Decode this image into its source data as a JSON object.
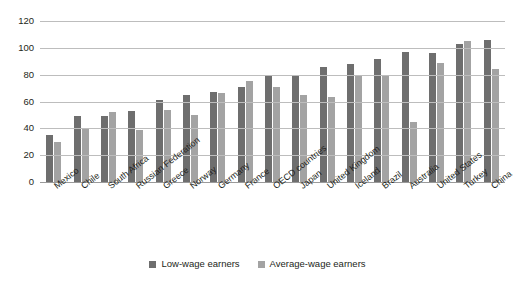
{
  "chart_data": {
    "type": "bar",
    "title": "",
    "subtitle": "",
    "xlabel": "",
    "ylabel": "",
    "ylim": [
      0,
      120
    ],
    "ytick_values": [
      0,
      20,
      40,
      60,
      80,
      100,
      120
    ],
    "ytick_labels": [
      "0",
      "20",
      "40",
      "60",
      "80",
      "100",
      "120"
    ],
    "grid": true,
    "legend_position": "bottom-center",
    "orientation": "vertical",
    "categories": [
      "Mexico",
      "Chile",
      "South Africa",
      "Russian Federation",
      "Greece",
      "Norway",
      "Germany",
      "France",
      "OECD countries",
      "Japan",
      "United Kingdom",
      "Iceland",
      "Brazil",
      "Australia",
      "United States",
      "Turkey",
      "China"
    ],
    "series": [
      {
        "name": "Low-wage earners",
        "color": "#6e6e6e",
        "values": [
          35,
          49,
          49,
          53,
          61,
          65,
          67,
          71,
          79,
          80,
          86,
          88,
          92,
          97,
          96,
          103,
          106
        ]
      },
      {
        "name": "Average-wage earners",
        "color": "#a3a3a3",
        "values": [
          30,
          40,
          52,
          39,
          54,
          50,
          66,
          75,
          71,
          65,
          63,
          80,
          79,
          45,
          89,
          105,
          84
        ]
      }
    ]
  },
  "colors": {
    "low_wage": "#6e6e6e",
    "average_wage": "#a3a3a3",
    "gridline": "#bdbdbd",
    "baseline": "#9a9a9a",
    "text": "#231f20",
    "background": "#ffffff"
  }
}
